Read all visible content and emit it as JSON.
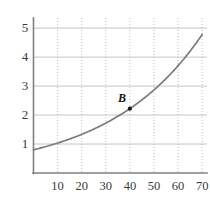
{
  "chart_data": {
    "type": "line",
    "title": "",
    "subtitle": "",
    "xlabel": "",
    "ylabel": "",
    "xlim": [
      0,
      72
    ],
    "ylim": [
      0,
      5.35
    ],
    "grid": true,
    "grid_style": {
      "horizontal": "solid",
      "vertical": "dotted"
    },
    "legend": "none",
    "x_ticks": [
      10,
      20,
      30,
      40,
      50,
      60,
      70
    ],
    "x_tick_labels": [
      "10",
      "20",
      "30",
      "40",
      "50",
      "60",
      "70"
    ],
    "y_ticks": [
      1,
      2,
      3,
      4,
      5
    ],
    "y_tick_labels": [
      "1",
      "2",
      "3",
      "4",
      "5"
    ],
    "series": [
      {
        "name": "curve",
        "kind": "exponential",
        "color": "#7b7b7b",
        "x": [
          0,
          5,
          10,
          15,
          20,
          25,
          30,
          35,
          40,
          45,
          50,
          55,
          60,
          65,
          70
        ],
        "values": [
          0.8,
          0.91,
          1.03,
          1.17,
          1.33,
          1.51,
          1.72,
          1.95,
          2.22,
          2.52,
          2.87,
          3.26,
          3.7,
          4.21,
          4.78
        ]
      }
    ],
    "annotations": [
      {
        "label": "B",
        "x": 40,
        "y": 2.22,
        "marker": "dot",
        "marker_color": "#1a1a1a",
        "label_offset": "above-left"
      }
    ]
  },
  "axes": {
    "y_axis_name": "y-axis",
    "x_axis_name": "x-axis"
  }
}
